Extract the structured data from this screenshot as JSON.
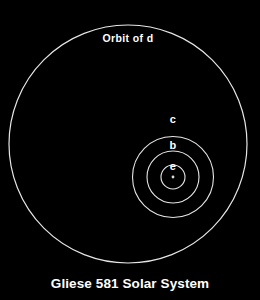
{
  "figure": {
    "title": "Gliese 581 Solar System",
    "background_color": "#000000",
    "line_color": "#e6e6e6",
    "text_color": "#ffffff",
    "outer_orbit_label": "Orbit of d"
  },
  "chart_data": {
    "type": "scatter",
    "title": "Gliese 581 Solar System",
    "subtitle": "",
    "xlabel": "",
    "ylabel": "",
    "grid": false,
    "legend_position": "none",
    "annotations": [
      {
        "text": "Orbit of d",
        "target": "d",
        "x": 128,
        "y": 38
      },
      {
        "text": "c",
        "target": "c",
        "x": 173,
        "y": 119
      },
      {
        "text": "b",
        "target": "b",
        "x": 173,
        "y": 145
      },
      {
        "text": "e",
        "target": "e",
        "x": 173,
        "y": 166
      }
    ],
    "star": {
      "name": "Gliese 581",
      "cx": 173,
      "cy": 177,
      "r": 1.4
    },
    "orbits": [
      {
        "name": "d",
        "label": "Orbit of d",
        "cx": 128,
        "cy": 144,
        "r": 119
      },
      {
        "name": "c",
        "label": "c",
        "cx": 173,
        "cy": 177,
        "r": 40.5
      },
      {
        "name": "b",
        "label": "b",
        "cx": 173,
        "cy": 177,
        "r": 26
      },
      {
        "name": "e",
        "label": "e",
        "cx": 173,
        "cy": 177,
        "r": 12
      }
    ]
  }
}
